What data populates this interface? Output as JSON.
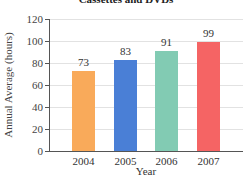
{
  "chart_data": {
    "type": "bar",
    "title": "Cassettes and DVDs",
    "xlabel": "Year",
    "ylabel": "Annual Average (hours)",
    "categories": [
      "2004",
      "2005",
      "2006",
      "2007"
    ],
    "values": [
      73,
      83,
      91,
      99
    ],
    "colors": [
      "#F9AA5A",
      "#4A7FD6",
      "#82CBB3",
      "#F56464"
    ],
    "ylim": [
      0,
      120
    ],
    "yticks": [
      0,
      20,
      40,
      60,
      80,
      100,
      120
    ],
    "grid": true,
    "data_labels": [
      "73",
      "83",
      "91",
      "99"
    ]
  }
}
